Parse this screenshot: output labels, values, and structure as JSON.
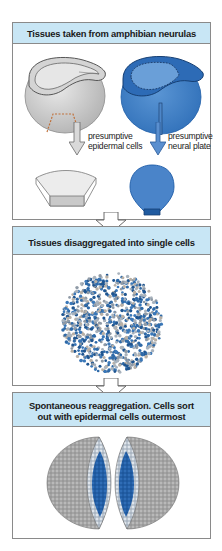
{
  "panels": [
    {
      "title": "Tissues taken from amphibian neurulas",
      "labels": {
        "left": [
          "presumptive",
          "epidermal cells"
        ],
        "right": [
          "presumptive",
          "neural plate"
        ]
      },
      "illustrations": [
        "neurula-gray-with-epidermal-region",
        "neurula-blue-with-neural-plate",
        "epidermal-tissue-piece",
        "neural-plate-tissue-piece"
      ]
    },
    {
      "title": "Tissues disaggregated into single cells",
      "illustrations": [
        "mixed-cell-suspension-sphere"
      ]
    },
    {
      "title_line1": "Spontaneous reaggregation. Cells sort",
      "title_line2": "out with epidermal cells outermost",
      "illustrations": [
        "reaggregate-left-half",
        "reaggregate-right-half"
      ]
    }
  ],
  "colors": {
    "header_bg": "#c8e6f5",
    "epidermal_gray": "#c9c9c9",
    "neural_blue": "#3f7fc4",
    "neural_blue_dark": "#1f5ea8",
    "dashed_orange": "#c0703a",
    "border": "#8a8a8a"
  }
}
